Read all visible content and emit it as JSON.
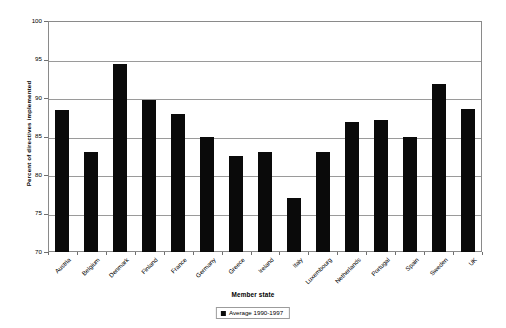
{
  "chart_data": {
    "type": "bar",
    "title": "",
    "xlabel": "Member state",
    "ylabel": "Percent of directives implemented",
    "ylim": [
      70,
      100
    ],
    "ytick_labels": [
      "100",
      "95",
      "90",
      "85",
      "80",
      "75",
      "70"
    ],
    "ytick_values": [
      100,
      95,
      90,
      85,
      80,
      75,
      70
    ],
    "grid": true,
    "legend_position": "bottom",
    "series": [
      {
        "name": "Average 1990-1997",
        "color": "#0a0a0a",
        "values": [
          88.5,
          83.0,
          94.4,
          89.8,
          87.9,
          85.0,
          82.5,
          83.0,
          77.0,
          83.0,
          86.9,
          87.2,
          85.0,
          91.8,
          88.6
        ]
      }
    ],
    "categories": [
      "Austria",
      "Belgium",
      "Denmark",
      "Finland",
      "France",
      "Germany",
      "Greece",
      "Ireland",
      "Italy",
      "Luxembourg",
      "Netherlands",
      "Portugal",
      "Spain",
      "Sweden",
      "UK"
    ]
  },
  "legend": {
    "entries": [
      {
        "label": "Average 1990-1997",
        "color": "#0a0a0a"
      }
    ]
  }
}
